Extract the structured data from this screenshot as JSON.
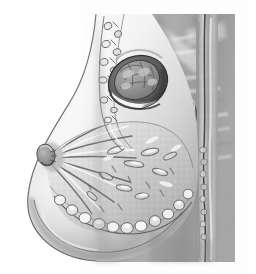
{
  "figure": {
    "modality": "grayscale anatomical illustration",
    "caption": "",
    "width": 256,
    "height": 274,
    "background_color": "#ffffff"
  },
  "palette": {
    "background": "#ffffff",
    "skin_light": "#f2f2f2",
    "skin_shadow": "#b9b9b9",
    "tissue_mid": "#a9a9a9",
    "tissue_dark": "#8a8a8a",
    "muscle_base": "#9b9b9b",
    "muscle_stripe_light": "#e8e8e8",
    "muscle_stripe_dark": "#7d7d7d",
    "mass_ring_dark": "#4a4a4a",
    "mass_ring_mid": "#6d6d6d",
    "mass_interior": "#8f8f8f",
    "fluid_level_white": "#fafafa",
    "outline_stroke": "#3b3b3b",
    "fat_lobule_light": "#fbfbfb",
    "duct_stroke": "#6a6a6a"
  },
  "regions": [
    {
      "id": "breast-contour",
      "label": "Breast skin contour",
      "interactable": false
    },
    {
      "id": "breast-parenchyma",
      "label": "Breast parenchyma",
      "interactable": false
    },
    {
      "id": "nipple",
      "label": "Nipple",
      "interactable": false
    },
    {
      "id": "areola",
      "label": "Areola",
      "interactable": false
    },
    {
      "id": "lactiferous-ducts",
      "label": "Lactiferous ducts",
      "interactable": false
    },
    {
      "id": "glandular-lobules",
      "label": "Glandular lobules",
      "interactable": false
    },
    {
      "id": "subcutaneous-fat",
      "label": "Subcutaneous fat lobules",
      "interactable": false
    },
    {
      "id": "coopers-ligaments",
      "label": "Suspensory (Cooper's) ligaments",
      "interactable": false
    },
    {
      "id": "axillary-tail",
      "label": "Axillary tail nodular band",
      "interactable": false
    },
    {
      "id": "mass-lesion",
      "label": "Cystic mass with fluid level",
      "interactable": false
    },
    {
      "id": "pectoralis-muscle",
      "label": "Pectoralis major muscle",
      "interactable": false
    },
    {
      "id": "chest-wall",
      "label": "Chest wall / sternal border",
      "interactable": false
    },
    {
      "id": "rib-section",
      "label": "Rib cross-section",
      "interactable": false
    },
    {
      "id": "inframammary-fold",
      "label": "Inframammary fold",
      "interactable": false
    }
  ],
  "geometry": {
    "gray_block": {
      "x": 96,
      "y": 14,
      "width": 139,
      "height": 248
    },
    "mass_center": {
      "cx": 138,
      "cy": 82,
      "rx": 28,
      "ry": 24,
      "rotation": -22
    },
    "fluid_level_y": 96,
    "nipple_point": {
      "x": 47,
      "y": 157
    },
    "chest_wall_x": 205,
    "rib_marker": {
      "x": 190,
      "y": 114
    }
  }
}
